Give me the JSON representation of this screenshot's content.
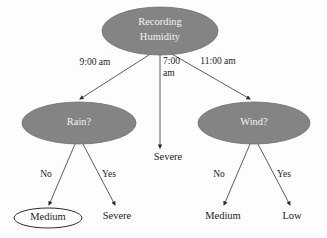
{
  "diagram": {
    "type": "decision-tree",
    "title": "",
    "colors": {
      "decision_node_fill": "#848484",
      "decision_node_stroke": "#6e6e6e",
      "decision_node_text": "#f2f2f2",
      "leaf_outline_stroke": "#2b2b2b",
      "leaf_fill": "#ffffff",
      "edge_stroke": "#4a4a4a",
      "text": "#1c1c1c",
      "background": "#fdfdfd"
    },
    "root": {
      "id": "root",
      "label_line1": "Recording",
      "label_line2": "Humidity",
      "cx": 160,
      "cy": 31,
      "rx": 58,
      "ry": 24
    },
    "decision_nodes": [
      {
        "id": "rain",
        "label": "Rain?",
        "cx": 79,
        "cy": 123,
        "rx": 57,
        "ry": 21
      },
      {
        "id": "wind",
        "label": "Wind?",
        "cx": 254,
        "cy": 123,
        "rx": 56,
        "ry": 21
      }
    ],
    "root_edges": [
      {
        "id": "edge-root-rain",
        "label": "9:00 am",
        "label_x": 95,
        "label_y": 63,
        "target": "rain"
      },
      {
        "id": "edge-root-severe",
        "label_line1": "7:00",
        "label_line2": "am",
        "label_x": 165,
        "label_y": 62,
        "target": "severe-center"
      },
      {
        "id": "edge-root-wind",
        "label": "11:00 am",
        "label_x": 218,
        "label_y": 62,
        "target": "wind"
      }
    ],
    "branch_edges": [
      {
        "id": "edge-rain-no",
        "label": "No",
        "label_x": 46,
        "label_y": 175,
        "target": "medium-left"
      },
      {
        "id": "edge-rain-yes",
        "label": "Yes",
        "label_x": 109,
        "label_y": 175,
        "target": "severe-left"
      },
      {
        "id": "edge-wind-no",
        "label": "No",
        "label_x": 219,
        "label_y": 175,
        "target": "medium-right"
      },
      {
        "id": "edge-wind-yes",
        "label": "Yes",
        "label_x": 284,
        "label_y": 175,
        "target": "low-right"
      }
    ],
    "leaves": [
      {
        "id": "severe-center",
        "label": "Severe",
        "x": 168,
        "y": 158,
        "outlined": false
      },
      {
        "id": "medium-left",
        "label": "Medium",
        "x": 48,
        "y": 218,
        "outlined": true,
        "rx": 34,
        "ry": 10
      },
      {
        "id": "severe-left",
        "label": "Severe",
        "x": 117,
        "y": 217,
        "outlined": false
      },
      {
        "id": "medium-right",
        "label": "Medium",
        "x": 223,
        "y": 217,
        "outlined": false
      },
      {
        "id": "low-right",
        "label": "Low",
        "x": 292,
        "y": 217,
        "outlined": false
      }
    ]
  }
}
